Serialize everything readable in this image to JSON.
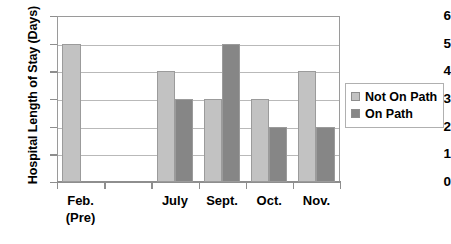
{
  "chart_data": {
    "type": "bar",
    "title": "",
    "xlabel": "",
    "ylabel": "Hospital Length of Stay (Days)",
    "ylim": [
      0,
      6
    ],
    "yticks": [
      "0",
      "1",
      "2",
      "3",
      "4",
      "5",
      "6"
    ],
    "grid": true,
    "legend_position": "right",
    "categories": [
      "Feb.\n(Pre)",
      "",
      "July",
      "Sept.",
      "Oct.",
      "Nov."
    ],
    "category_labels": [
      {
        "line1": "Feb.",
        "line2": "(Pre)"
      },
      {
        "line1": "",
        "line2": ""
      },
      {
        "line1": "July",
        "line2": ""
      },
      {
        "line1": "Sept.",
        "line2": ""
      },
      {
        "line1": "Oct.",
        "line2": ""
      },
      {
        "line1": "Nov.",
        "line2": ""
      }
    ],
    "series": [
      {
        "name": "Not On Path",
        "color": "#c2c2c2",
        "values": [
          5,
          null,
          4,
          3,
          3,
          4
        ]
      },
      {
        "name": "On Path",
        "color": "#868686",
        "values": [
          null,
          null,
          3,
          5,
          2,
          2
        ]
      }
    ]
  },
  "legend": {
    "items": [
      {
        "label": "Not On Path",
        "color": "#c2c2c2"
      },
      {
        "label": "On Path",
        "color": "#868686"
      }
    ]
  },
  "axis": {
    "y_title": "Hospital Length of Stay (Days)",
    "y_ticks": [
      "6",
      "5",
      "4",
      "3",
      "2",
      "1",
      "0"
    ]
  }
}
